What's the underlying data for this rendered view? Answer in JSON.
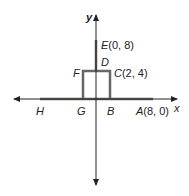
{
  "diagram": {
    "axes": {
      "x_label": "x",
      "y_label": "y"
    },
    "points": [
      {
        "name": "E",
        "coords": "(0, 8)"
      },
      {
        "name": "D",
        "coords": ""
      },
      {
        "name": "F",
        "coords": ""
      },
      {
        "name": "C",
        "coords": "(2, 4)"
      },
      {
        "name": "H",
        "coords": ""
      },
      {
        "name": "G",
        "coords": ""
      },
      {
        "name": "B",
        "coords": ""
      },
      {
        "name": "A",
        "coords": "(8, 0)"
      }
    ],
    "colors": {
      "axis": "#222222",
      "shape": "#666666"
    }
  }
}
